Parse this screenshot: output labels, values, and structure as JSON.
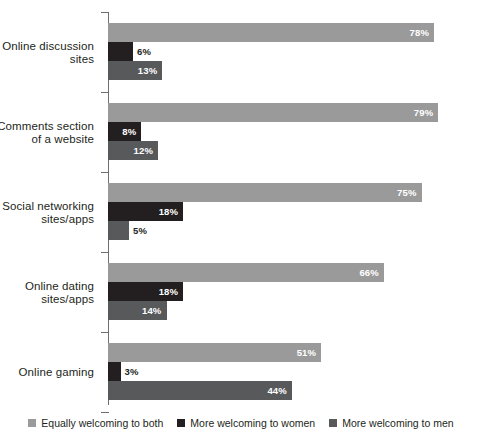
{
  "chart_data": {
    "type": "bar",
    "orientation": "horizontal",
    "title": "",
    "subtitle": "",
    "xlabel": "",
    "ylabel": "",
    "xlim": [
      0,
      100
    ],
    "grid": false,
    "legend_position": "bottom",
    "value_suffix": "%",
    "categories": [
      "Online discussion sites",
      "Comments section of a website",
      "Social networking sites/apps",
      "Online dating sites/apps",
      "Online gaming"
    ],
    "category_lines": [
      [
        "Online discussion",
        "sites"
      ],
      [
        "Comments section",
        "of a website"
      ],
      [
        "Social networking",
        "sites/apps"
      ],
      [
        "Online dating",
        "sites/apps"
      ],
      [
        "Online gaming"
      ]
    ],
    "series": [
      {
        "name": "Equally welcoming to both",
        "color": "#9a9a9a",
        "values": [
          78,
          79,
          75,
          66,
          51
        ],
        "labels": [
          "78%",
          "79%",
          "75%",
          "66%",
          "51%"
        ]
      },
      {
        "name": "More welcoming to women",
        "color": "#231f20",
        "values": [
          6,
          8,
          18,
          18,
          3
        ],
        "labels": [
          "6%",
          "8%",
          "18%",
          "18%",
          "3%"
        ]
      },
      {
        "name": "More welcoming to men",
        "color": "#58595b",
        "values": [
          13,
          12,
          5,
          14,
          44
        ],
        "labels": [
          "13%",
          "12%",
          "5%",
          "14%",
          "44%"
        ]
      }
    ]
  },
  "legend": {
    "items": [
      {
        "label": "Equally welcoming to both",
        "color": "#9a9a9a"
      },
      {
        "label": "More welcoming to women",
        "color": "#231f20"
      },
      {
        "label": "More welcoming to men",
        "color": "#58595b"
      }
    ]
  },
  "axis": {
    "line_color": "#6d6e71",
    "tick_count": 5
  }
}
